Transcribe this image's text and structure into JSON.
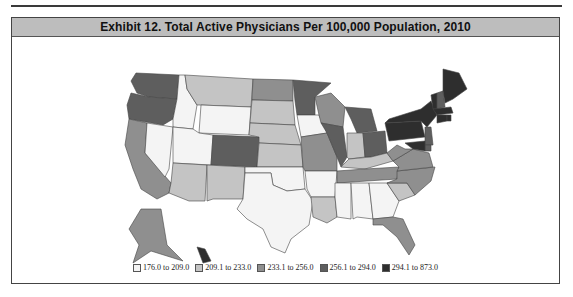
{
  "chart_data": {
    "type": "choropleth",
    "title": "Exhibit 12. Total Active Physicians Per 100,000 Population, 2010",
    "legend_position": "bottom",
    "classes": [
      {
        "label": "176.0 to 209.0",
        "color": "#f4f4f4"
      },
      {
        "label": "209.1 to 233.0",
        "color": "#c4c4c4"
      },
      {
        "label": "233.1 to 256.0",
        "color": "#8f8f8f"
      },
      {
        "label": "256.1 to 294.0",
        "color": "#5e5e5e"
      },
      {
        "label": "294.1 to 873.0",
        "color": "#2e2e2e"
      }
    ],
    "states": {
      "WA": 3,
      "OR": 3,
      "CA": 2,
      "NV": 0,
      "ID": 0,
      "MT": 1,
      "WY": 0,
      "UT": 0,
      "AZ": 1,
      "CO": 3,
      "NM": 1,
      "ND": 2,
      "SD": 1,
      "NE": 1,
      "KS": 1,
      "OK": 0,
      "TX": 0,
      "MN": 3,
      "IA": 0,
      "MO": 2,
      "AR": 0,
      "LA": 1,
      "WI": 2,
      "IL": 3,
      "MI": 3,
      "IN": 1,
      "OH": 3,
      "KY": 1,
      "TN": 2,
      "MS": 0,
      "AL": 0,
      "GA": 0,
      "FL": 2,
      "SC": 1,
      "NC": 2,
      "VA": 2,
      "WV": 2,
      "PA": 4,
      "NY": 4,
      "VT": 4,
      "NH": 3,
      "ME": 4,
      "MA": 4,
      "CT": 4,
      "RI": 4,
      "NJ": 3,
      "DE": 3,
      "MD": 4,
      "AK": 2,
      "HI": 4
    }
  },
  "header": {
    "title": "Exhibit 12. Total Active Physicians Per 100,000 Population, 2010"
  },
  "legend": {
    "items": [
      {
        "label": "176.0 to 209.0",
        "color": "#f4f4f4"
      },
      {
        "label": "209.1 to 233.0",
        "color": "#c4c4c4"
      },
      {
        "label": "233.1 to 256.0",
        "color": "#8f8f8f"
      },
      {
        "label": "256.1 to 294.0",
        "color": "#5e5e5e"
      },
      {
        "label": "294.1 to 873.0",
        "color": "#2e2e2e"
      }
    ]
  }
}
